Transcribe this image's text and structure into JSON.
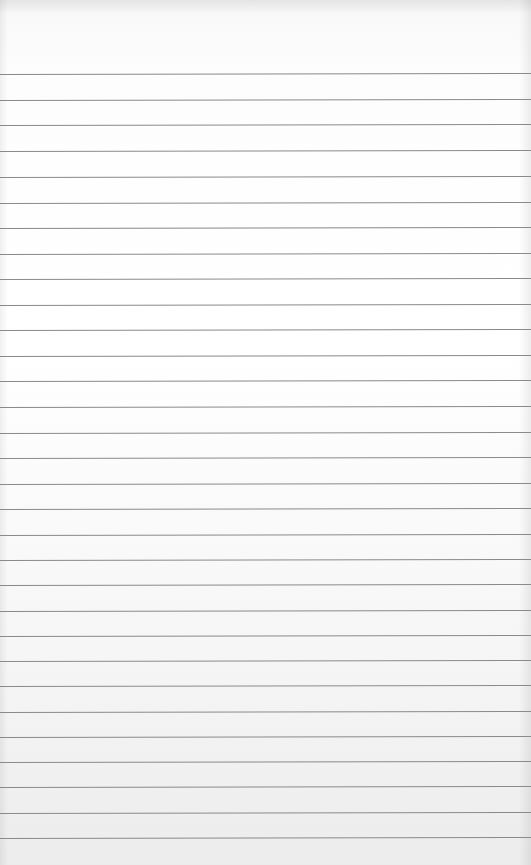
{
  "paper": {
    "type": "ruled-notebook-page",
    "background_color": "#ffffff",
    "line_color": "#8a8a8a",
    "rules_y": [
      74,
      100,
      125,
      151,
      177,
      203,
      228,
      254,
      279,
      305,
      330,
      356,
      381,
      407,
      433,
      458,
      484,
      509,
      535,
      560,
      585,
      611,
      636,
      661,
      686,
      712,
      737,
      762,
      787,
      813,
      838
    ]
  }
}
